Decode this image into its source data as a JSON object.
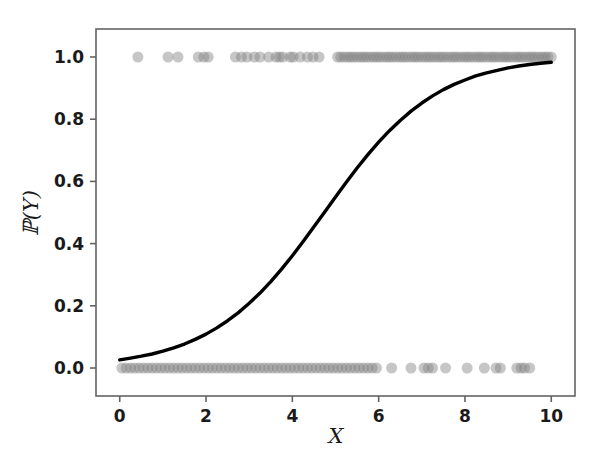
{
  "figure": {
    "width": 605,
    "height": 457,
    "background": "#ffffff"
  },
  "axis": {
    "xlabel": "X",
    "ylabel": "ℙ(Y)",
    "ylabel_plain": "P(Y)",
    "xticks": [
      "0",
      "2",
      "4",
      "6",
      "8",
      "10"
    ],
    "yticks": [
      "0.0",
      "0.2",
      "0.4",
      "0.6",
      "0.8",
      "1.0"
    ],
    "spine_color": "#636363",
    "tick_label_color": "#1a1a1a"
  },
  "chart_data": {
    "type": "line",
    "title": "",
    "subtitle": "",
    "xlabel": "X",
    "ylabel": "ℙ(Y)",
    "xlim": [
      -0.55,
      10.55
    ],
    "ylim": [
      -0.09,
      1.09
    ],
    "xticks": [
      0,
      2,
      4,
      6,
      8,
      10
    ],
    "yticks": [
      0.0,
      0.2,
      0.4,
      0.6,
      0.8,
      1.0
    ],
    "grid": false,
    "legend": null,
    "series": [
      {
        "name": "Logistic fit",
        "type": "line",
        "color": "#000000",
        "linewidth": 3.4,
        "model": "sigmoid",
        "intercept": -3.62,
        "slope": 0.745,
        "x": [
          0.0,
          0.25,
          0.5,
          0.75,
          1.0,
          1.25,
          1.5,
          1.75,
          2.0,
          2.25,
          2.5,
          2.75,
          3.0,
          3.25,
          3.5,
          3.75,
          4.0,
          4.25,
          4.5,
          4.75,
          5.0,
          5.25,
          5.5,
          5.75,
          6.0,
          6.25,
          6.5,
          6.75,
          7.0,
          7.25,
          7.5,
          7.75,
          8.0,
          8.25,
          8.5,
          8.75,
          9.0,
          9.25,
          9.5,
          9.75,
          10.0
        ],
        "y": [
          0.026,
          0.032,
          0.038,
          0.045,
          0.054,
          0.065,
          0.077,
          0.092,
          0.109,
          0.129,
          0.152,
          0.178,
          0.208,
          0.241,
          0.278,
          0.318,
          0.361,
          0.407,
          0.454,
          0.502,
          0.55,
          0.597,
          0.643,
          0.686,
          0.726,
          0.763,
          0.796,
          0.826,
          0.852,
          0.875,
          0.895,
          0.912,
          0.926,
          0.939,
          0.949,
          0.957,
          0.965,
          0.971,
          0.976,
          0.98,
          0.983
        ]
      },
      {
        "name": "Observations (Y = 1)",
        "type": "scatter",
        "color": "#808080",
        "alpha": 0.45,
        "marker_size": 11,
        "y_value": 1.0,
        "x": [
          0.42,
          1.12,
          1.35,
          1.82,
          1.95,
          2.05,
          2.68,
          2.82,
          2.95,
          3.12,
          3.25,
          3.45,
          3.62,
          3.7,
          3.78,
          3.95,
          4.02,
          4.18,
          4.35,
          4.48,
          4.62,
          5.05,
          5.12,
          5.2,
          5.28,
          5.35,
          5.42,
          5.5,
          5.58,
          5.65,
          5.72,
          5.8,
          5.88,
          5.95,
          6.02,
          6.1,
          6.18,
          6.25,
          6.32,
          6.4,
          6.48,
          6.55,
          6.62,
          6.7,
          6.78,
          6.85,
          6.92,
          7.0,
          7.08,
          7.15,
          7.22,
          7.3,
          7.38,
          7.45,
          7.52,
          7.6,
          7.68,
          7.75,
          7.82,
          7.9,
          7.98,
          8.05,
          8.12,
          8.2,
          8.28,
          8.35,
          8.42,
          8.5,
          8.58,
          8.65,
          8.72,
          8.8,
          8.88,
          8.95,
          9.02,
          9.1,
          9.18,
          9.25,
          9.32,
          9.4,
          9.48,
          9.55,
          9.62,
          9.7,
          9.78,
          9.85,
          9.92,
          10.0
        ]
      },
      {
        "name": "Observations (Y = 0)",
        "type": "scatter",
        "color": "#808080",
        "alpha": 0.45,
        "marker_size": 11,
        "y_value": 0.0,
        "x": [
          0.05,
          0.15,
          0.25,
          0.35,
          0.45,
          0.55,
          0.65,
          0.75,
          0.85,
          0.95,
          1.05,
          1.15,
          1.25,
          1.35,
          1.45,
          1.55,
          1.65,
          1.75,
          1.85,
          1.95,
          2.05,
          2.15,
          2.25,
          2.35,
          2.45,
          2.55,
          2.65,
          2.75,
          2.85,
          2.95,
          3.05,
          3.15,
          3.25,
          3.35,
          3.45,
          3.55,
          3.65,
          3.75,
          3.85,
          3.95,
          4.05,
          4.15,
          4.25,
          4.35,
          4.45,
          4.55,
          4.65,
          4.75,
          4.85,
          4.95,
          5.05,
          5.15,
          5.25,
          5.35,
          5.45,
          5.55,
          5.65,
          5.75,
          5.85,
          5.95,
          6.3,
          6.75,
          7.05,
          7.15,
          7.25,
          7.55,
          8.05,
          8.45,
          8.72,
          8.82,
          9.2,
          9.3,
          9.38,
          9.5
        ]
      }
    ]
  }
}
